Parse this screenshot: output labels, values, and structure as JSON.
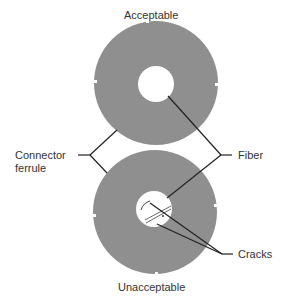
{
  "diagram": {
    "top_label": "Acceptable",
    "bottom_label": "Unacceptable",
    "left_label_line1": "Connector",
    "left_label_line2": "ferrule",
    "right_label_fiber": "Fiber",
    "right_label_cracks": "Cracks",
    "colors": {
      "ferrule": "#8f8f8f",
      "fiber": "#ffffff",
      "lines": "#222222"
    }
  }
}
